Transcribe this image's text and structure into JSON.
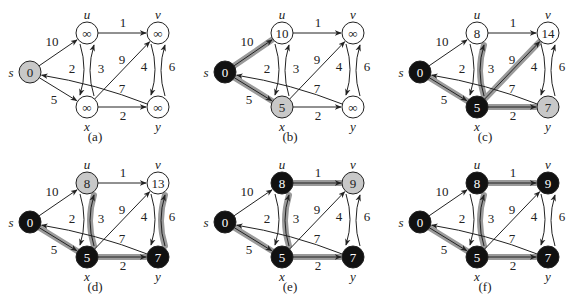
{
  "colors": {
    "black_node": "#111111",
    "gray_node": "#c8c8c8",
    "white_node": "#ffffff",
    "highlight_edge": "#9a9a9a",
    "edge": "#222222"
  },
  "nodes": [
    {
      "id": "s",
      "label": "s",
      "x": 30,
      "y": 72,
      "label_pos": "left"
    },
    {
      "id": "u",
      "label": "u",
      "x": 87,
      "y": 33,
      "label_pos": "top"
    },
    {
      "id": "v",
      "label": "v",
      "x": 158,
      "y": 33,
      "label_pos": "top"
    },
    {
      "id": "x",
      "label": "x",
      "x": 87,
      "y": 107,
      "label_pos": "bottom"
    },
    {
      "id": "y",
      "label": "y",
      "x": 158,
      "y": 107,
      "label_pos": "bottom"
    }
  ],
  "edges": [
    {
      "from": "s",
      "to": "u",
      "weight": "10",
      "lx": 52,
      "ly": 46,
      "curve": 0
    },
    {
      "from": "s",
      "to": "x",
      "weight": "5",
      "lx": 54,
      "ly": 104,
      "curve": 0
    },
    {
      "from": "u",
      "to": "v",
      "weight": "1",
      "lx": 123,
      "ly": 27,
      "curve": 0
    },
    {
      "from": "u",
      "to": "x",
      "weight": "2",
      "lx": 72,
      "ly": 73,
      "curve": -8
    },
    {
      "from": "x",
      "to": "u",
      "weight": "3",
      "lx": 101,
      "ly": 73,
      "curve": -8
    },
    {
      "from": "x",
      "to": "v",
      "weight": "9",
      "lx": 122,
      "ly": 64,
      "curve": 0
    },
    {
      "from": "x",
      "to": "y",
      "weight": "2",
      "lx": 123,
      "ly": 120,
      "curve": 0
    },
    {
      "from": "y",
      "to": "s",
      "weight": "7",
      "lx": 122,
      "ly": 93,
      "curve": 6
    },
    {
      "from": "v",
      "to": "y",
      "weight": "4",
      "lx": 144,
      "ly": 71,
      "curve": -8
    },
    {
      "from": "y",
      "to": "v",
      "weight": "6",
      "lx": 172,
      "ly": 71,
      "curve": -8
    }
  ],
  "panels": [
    {
      "caption": "(a)",
      "ox": 0,
      "oy": 0,
      "values": {
        "s": "0",
        "u": "∞",
        "v": "∞",
        "x": "∞",
        "y": "∞"
      },
      "states": {
        "s": "gray",
        "u": "white",
        "v": "white",
        "x": "white",
        "y": "white"
      },
      "shaded_edges": []
    },
    {
      "caption": "(b)",
      "ox": 195,
      "oy": 0,
      "values": {
        "s": "0",
        "u": "10",
        "v": "∞",
        "x": "5",
        "y": "∞"
      },
      "states": {
        "s": "black",
        "u": "white",
        "v": "white",
        "x": "gray",
        "y": "white"
      },
      "shaded_edges": [
        "s-u",
        "s-x"
      ]
    },
    {
      "caption": "(c)",
      "ox": 390,
      "oy": 0,
      "values": {
        "s": "0",
        "u": "8",
        "v": "14",
        "x": "5",
        "y": "7"
      },
      "states": {
        "s": "black",
        "u": "white",
        "v": "white",
        "x": "black",
        "y": "gray"
      },
      "shaded_edges": [
        "s-x",
        "x-u",
        "x-v",
        "x-y"
      ]
    },
    {
      "caption": "(d)",
      "ox": 0,
      "oy": 150,
      "values": {
        "s": "0",
        "u": "8",
        "v": "13",
        "x": "5",
        "y": "7"
      },
      "states": {
        "s": "black",
        "u": "gray",
        "v": "white",
        "x": "black",
        "y": "black"
      },
      "shaded_edges": [
        "s-x",
        "x-u",
        "x-y",
        "y-v"
      ]
    },
    {
      "caption": "(e)",
      "ox": 195,
      "oy": 150,
      "values": {
        "s": "0",
        "u": "8",
        "v": "9",
        "x": "5",
        "y": "7"
      },
      "states": {
        "s": "black",
        "u": "black",
        "v": "gray",
        "x": "black",
        "y": "black"
      },
      "shaded_edges": [
        "s-x",
        "x-u",
        "u-v",
        "x-y"
      ]
    },
    {
      "caption": "(f)",
      "ox": 390,
      "oy": 150,
      "values": {
        "s": "0",
        "u": "8",
        "v": "9",
        "x": "5",
        "y": "7"
      },
      "states": {
        "s": "black",
        "u": "black",
        "v": "black",
        "x": "black",
        "y": "black"
      },
      "shaded_edges": [
        "s-x",
        "x-u",
        "u-v",
        "x-y"
      ]
    }
  ]
}
